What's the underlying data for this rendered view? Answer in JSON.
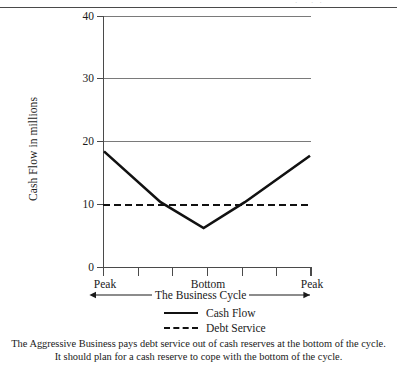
{
  "page": {
    "top_ghost_text": "· ··"
  },
  "chart_data": {
    "type": "line",
    "title": "",
    "xlabel": "The Business Cycle",
    "ylabel": "Cash Flow in millions",
    "ylim": [
      0,
      40
    ],
    "yticks": [
      0,
      10,
      20,
      30,
      40
    ],
    "ytick_labels": [
      "0",
      "10",
      "20",
      "30",
      "40"
    ],
    "xlim": [
      0,
      6
    ],
    "xticks": [
      0,
      1,
      2,
      3,
      4,
      5,
      6
    ],
    "xtick_labels": [
      "Peak",
      "",
      "",
      "Bottom",
      "",
      "",
      "Peak"
    ],
    "grid": "horizontal",
    "legend_position": "below",
    "x": [
      0,
      1.65,
      2.9,
      4.1,
      6
    ],
    "series": [
      {
        "name": "Cash Flow",
        "style": "solid",
        "color": "#111111",
        "values": [
          18.5,
          10.4,
          6.3,
          10.4,
          17.8
        ]
      },
      {
        "name": "Debt Service",
        "style": "dashed",
        "color": "#111111",
        "constant_value": 10,
        "values": [
          10,
          10,
          10,
          10,
          10
        ]
      }
    ],
    "annotations": [
      {
        "name": "cycle-span-arrow",
        "label": "The Business Cycle",
        "from": "Peak",
        "to": "Peak"
      }
    ]
  },
  "axis": {
    "y_label": "Cash Flow in millions",
    "y_ticks": [
      "40",
      "30",
      "20",
      "10",
      "0"
    ],
    "x_ticks": [
      "Peak",
      "Bottom",
      "Peak"
    ]
  },
  "legend": {
    "items": [
      {
        "label": "Cash Flow",
        "style": "solid"
      },
      {
        "label": "Debt Service",
        "style": "dashed"
      }
    ]
  },
  "cycle": {
    "label": "The Business Cycle"
  },
  "caption": {
    "line1": "The Aggressive Business pays debt service out of cash reserves at the bottom of the cycle.",
    "line2": "It should plan for a cash reserve to cope with the bottom of the cycle."
  }
}
